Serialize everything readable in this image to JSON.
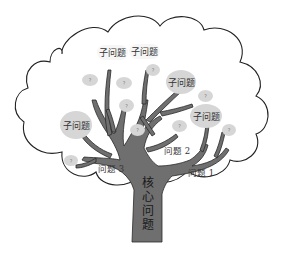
{
  "diagram": {
    "type": "problem-tree",
    "colors": {
      "trunk": "#6f6f6f",
      "outline": "#222222",
      "bubble": "#d6d6d6",
      "background": "#ffffff"
    },
    "core_problem": {
      "chars": [
        "核",
        "心",
        "问",
        "题"
      ]
    },
    "branches": [
      {
        "label": "问题 1"
      },
      {
        "label": "问题 2"
      },
      {
        "label": "问题 3"
      }
    ],
    "sub_problems": [
      {
        "label": "子问题"
      },
      {
        "label": "子问题"
      },
      {
        "label": "子问题"
      },
      {
        "label": "子问题"
      },
      {
        "label": "子问题"
      }
    ],
    "unknown_marker": "?"
  }
}
